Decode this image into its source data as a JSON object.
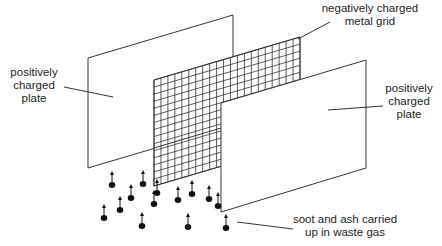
{
  "diagram": {
    "labels": {
      "left_plate": [
        "positively",
        "charged",
        "plate"
      ],
      "grid": [
        "negatively charged",
        "metal grid"
      ],
      "right_plate": [
        "positively",
        "charged",
        "plate"
      ],
      "particles": [
        "soot and ash carried",
        "up in waste gas"
      ]
    },
    "components": [
      {
        "id": "left-plate",
        "type": "plate",
        "charge": "positive"
      },
      {
        "id": "metal-grid",
        "type": "grid",
        "charge": "negative"
      },
      {
        "id": "right-plate",
        "type": "plate",
        "charge": "positive"
      }
    ],
    "particle_count": 13,
    "particle_direction": "up",
    "colors": {
      "line": "#333333",
      "particle": "#111111",
      "text": "#222222"
    }
  }
}
